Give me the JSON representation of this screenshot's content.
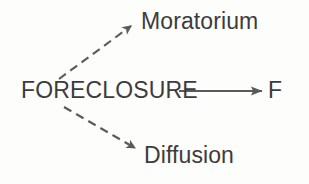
{
  "diagram": {
    "type": "node-link-diagram",
    "background_color": "#fdfdfc",
    "text_color": "#3c3c3c",
    "edge_color": "#5a5a5a",
    "nodes": [
      {
        "id": "foreclosure",
        "label": "FORECLOSURE",
        "role": "source",
        "style": "uppercase"
      },
      {
        "id": "moratorium",
        "label": "Moratorium",
        "role": "target",
        "style": "titlecase"
      },
      {
        "id": "diffusion",
        "label": "Diffusion",
        "role": "target",
        "style": "titlecase"
      },
      {
        "id": "f",
        "label": "F",
        "role": "target",
        "style": "titlecase"
      }
    ],
    "edges": [
      {
        "id": "edge-foreclosure-moratorium",
        "from": "foreclosure",
        "to": "moratorium",
        "line_style": "dashed",
        "arrowhead": "filled",
        "direction": "up-right"
      },
      {
        "id": "edge-foreclosure-f",
        "from": "foreclosure",
        "to": "f",
        "line_style": "solid",
        "arrowhead": "filled",
        "direction": "right"
      },
      {
        "id": "edge-foreclosure-diffusion",
        "from": "foreclosure",
        "to": "diffusion",
        "line_style": "dashed",
        "arrowhead": "filled",
        "direction": "down-right"
      }
    ]
  }
}
